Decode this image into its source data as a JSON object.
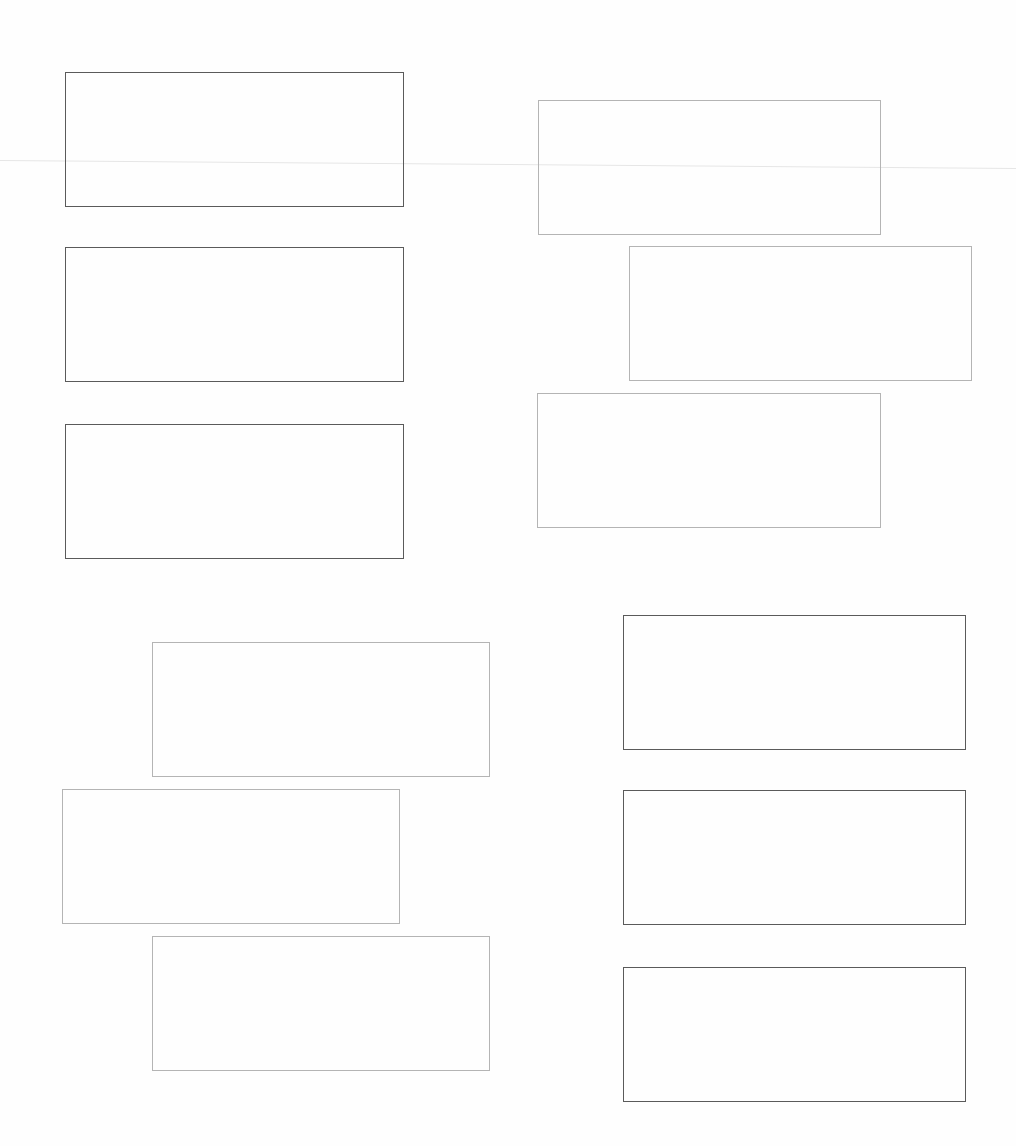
{
  "page": {
    "background": "#fefefe",
    "boxes": [
      {
        "id": "box-1",
        "x": 65,
        "y": 72,
        "w": 339,
        "h": 135,
        "tone": "dark"
      },
      {
        "id": "box-2",
        "x": 538,
        "y": 100,
        "w": 343,
        "h": 135,
        "tone": "light"
      },
      {
        "id": "box-3",
        "x": 65,
        "y": 247,
        "w": 339,
        "h": 135,
        "tone": "dark"
      },
      {
        "id": "box-4",
        "x": 629,
        "y": 246,
        "w": 343,
        "h": 135,
        "tone": "light"
      },
      {
        "id": "box-5",
        "x": 65,
        "y": 424,
        "w": 339,
        "h": 135,
        "tone": "dark"
      },
      {
        "id": "box-6",
        "x": 537,
        "y": 393,
        "w": 344,
        "h": 135,
        "tone": "light"
      },
      {
        "id": "box-7",
        "x": 152,
        "y": 642,
        "w": 338,
        "h": 135,
        "tone": "light"
      },
      {
        "id": "box-8",
        "x": 62,
        "y": 789,
        "w": 338,
        "h": 135,
        "tone": "light"
      },
      {
        "id": "box-9",
        "x": 152,
        "y": 936,
        "w": 338,
        "h": 135,
        "tone": "light"
      },
      {
        "id": "box-10",
        "x": 623,
        "y": 615,
        "w": 343,
        "h": 135,
        "tone": "dark"
      },
      {
        "id": "box-11",
        "x": 623,
        "y": 790,
        "w": 343,
        "h": 135,
        "tone": "dark"
      },
      {
        "id": "box-12",
        "x": 623,
        "y": 967,
        "w": 343,
        "h": 135,
        "tone": "dark"
      }
    ]
  }
}
